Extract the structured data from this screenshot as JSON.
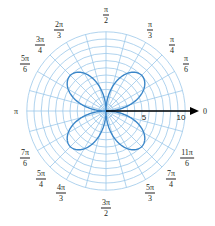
{
  "chart_data": {
    "type": "polar",
    "title": "",
    "curve": {
      "equation": "r = 7|sin(2θ)|",
      "description": "four-petal rose with petals centered at π/4, 3π/4, 5π/4, 7π/4",
      "amplitude": 7,
      "petals": 4,
      "color": "#3a86c8"
    },
    "radial_axis": {
      "range": [
        0,
        11
      ],
      "circle_step": 1,
      "tick_labels": [
        {
          "value": 5,
          "label": "5"
        },
        {
          "value": 10,
          "label": "10"
        }
      ],
      "axis_end_label": "0"
    },
    "angular_axis": {
      "spoke_step_deg": 15,
      "labels": [
        {
          "angle_deg": 0,
          "kind": "single",
          "text": "0"
        },
        {
          "angle_deg": 30,
          "kind": "frac",
          "num": "π",
          "den": "6"
        },
        {
          "angle_deg": 45,
          "kind": "frac",
          "num": "π",
          "den": "4"
        },
        {
          "angle_deg": 60,
          "kind": "frac",
          "num": "π",
          "den": "3"
        },
        {
          "angle_deg": 90,
          "kind": "frac",
          "num": "π",
          "den": "2"
        },
        {
          "angle_deg": 120,
          "kind": "frac",
          "num": "2π",
          "den": "3"
        },
        {
          "angle_deg": 135,
          "kind": "frac",
          "num": "3π",
          "den": "4"
        },
        {
          "angle_deg": 150,
          "kind": "frac",
          "num": "5π",
          "den": "6"
        },
        {
          "angle_deg": 180,
          "kind": "single",
          "text": "π"
        },
        {
          "angle_deg": 210,
          "kind": "frac",
          "num": "7π",
          "den": "6"
        },
        {
          "angle_deg": 225,
          "kind": "frac",
          "num": "5π",
          "den": "4"
        },
        {
          "angle_deg": 240,
          "kind": "frac",
          "num": "4π",
          "den": "3"
        },
        {
          "angle_deg": 270,
          "kind": "frac",
          "num": "3π",
          "den": "2"
        },
        {
          "angle_deg": 300,
          "kind": "frac",
          "num": "5π",
          "den": "3"
        },
        {
          "angle_deg": 315,
          "kind": "frac",
          "num": "7π",
          "den": "4"
        },
        {
          "angle_deg": 330,
          "kind": "frac",
          "num": "11π",
          "den": "6"
        }
      ]
    },
    "grid": true,
    "colors": {
      "grid": "#9cc8ea",
      "curve": "#3a86c8",
      "axis": "#000000",
      "text": "#231f20"
    }
  },
  "labels": {
    "a0": "0",
    "a30n": "π",
    "a30d": "6",
    "a45n": "π",
    "a45d": "4",
    "a60n": "π",
    "a60d": "3",
    "a90n": "π",
    "a90d": "2",
    "a120n": "2π",
    "a120d": "3",
    "a135n": "3π",
    "a135d": "4",
    "a150n": "5π",
    "a150d": "6",
    "a180": "π",
    "a210n": "7π",
    "a210d": "6",
    "a225n": "5π",
    "a225d": "4",
    "a240n": "4π",
    "a240d": "3",
    "a270n": "3π",
    "a270d": "2",
    "a300n": "5π",
    "a300d": "3",
    "a315n": "7π",
    "a315d": "4",
    "a330n": "11π",
    "a330d": "6",
    "r5": "5",
    "r10": "10"
  }
}
